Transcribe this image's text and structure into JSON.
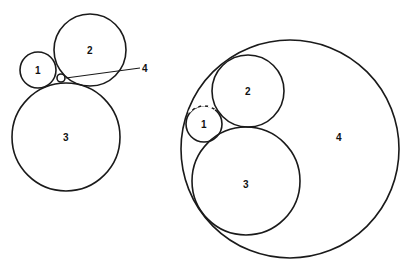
{
  "figure_left": {
    "circles": [
      {
        "id": "1",
        "label": "1",
        "cx": 38,
        "cy": 70,
        "r": 18
      },
      {
        "id": "2",
        "label": "2",
        "cx": 90,
        "cy": 50,
        "r": 36
      },
      {
        "id": "3",
        "label": "3",
        "cx": 66,
        "cy": 137,
        "r": 54
      },
      {
        "id": "4",
        "label": "4",
        "cx": 61,
        "cy": 78,
        "r": 4
      }
    ],
    "callout": {
      "label": "4",
      "x1": 66,
      "y1": 78,
      "x2": 140,
      "y2": 68
    }
  },
  "figure_right": {
    "circles": [
      {
        "id": "1",
        "label": "1",
        "cx": 204,
        "cy": 124,
        "r": 18
      },
      {
        "id": "2",
        "label": "2",
        "cx": 248,
        "cy": 91,
        "r": 36
      },
      {
        "id": "3",
        "label": "3",
        "cx": 246,
        "cy": 181,
        "r": 54
      },
      {
        "id": "4",
        "label": "4",
        "cx": 290,
        "cy": 149,
        "r": 109
      }
    ]
  },
  "labels": {
    "l1": "1",
    "l2": "2",
    "l3": "3",
    "l4": "4",
    "r1": "1",
    "r2": "2",
    "r3": "3",
    "r4": "4"
  },
  "colors": {
    "stroke": "#1a1a1a",
    "background": "#ffffff"
  }
}
